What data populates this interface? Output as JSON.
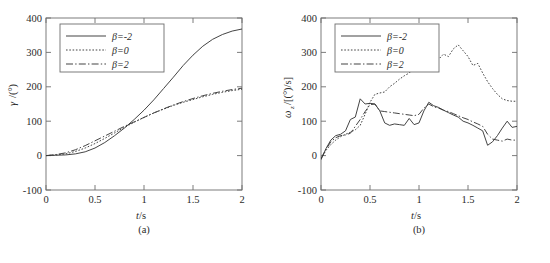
{
  "figure": {
    "background": "#ffffff",
    "line_color": "#3a3a3a",
    "axis_color": "#6e6e6e",
    "panels": [
      "a",
      "b"
    ]
  },
  "panel_a": {
    "caption": "(a)",
    "xlabel": "t/s",
    "ylabel": "γ/(°)",
    "ylabel_italic": "γ",
    "ylabel_rest": "/(°)",
    "xticks": [
      "0",
      "0.5",
      "1",
      "1.5",
      "2"
    ],
    "yticks": [
      "-100",
      "0",
      "100",
      "200",
      "300",
      "400"
    ],
    "legend": [
      {
        "label": "β=-2",
        "style": "solid"
      },
      {
        "label": "β=0",
        "style": "dotted"
      },
      {
        "label": "β=2",
        "style": "dashdot"
      }
    ]
  },
  "panel_b": {
    "caption": "(b)",
    "xlabel": "t/s",
    "ylabel": "ωz/[(°)/s]",
    "ylabel_italic": "ω",
    "ylabel_sub": "z",
    "ylabel_rest": "/[(°)/s]",
    "xticks": [
      "0",
      "0.5",
      "1",
      "1.5",
      "2"
    ],
    "yticks": [
      "-100",
      "0",
      "100",
      "200",
      "300",
      "400"
    ],
    "legend": [
      {
        "label": "β=-2",
        "style": "solid"
      },
      {
        "label": "β=0",
        "style": "dotted"
      },
      {
        "label": "β=2",
        "style": "dashdot"
      }
    ]
  },
  "chart_data": [
    {
      "type": "line",
      "title": "(a)",
      "xlabel": "t/s",
      "ylabel": "γ/(°)",
      "xlim": [
        0,
        2
      ],
      "ylim": [
        -100,
        400
      ],
      "xticks": [
        0,
        0.5,
        1,
        1.5,
        2
      ],
      "yticks": [
        -100,
        0,
        100,
        200,
        300,
        400
      ],
      "grid": false,
      "legend_position": "upper-left",
      "x": [
        0,
        0.1,
        0.2,
        0.3,
        0.4,
        0.5,
        0.6,
        0.7,
        0.8,
        0.9,
        1.0,
        1.1,
        1.2,
        1.3,
        1.4,
        1.5,
        1.6,
        1.7,
        1.8,
        1.9,
        2.0
      ],
      "series": [
        {
          "name": "β=-2",
          "style": "solid",
          "values": [
            0,
            1,
            2,
            5,
            11,
            22,
            38,
            58,
            80,
            105,
            132,
            162,
            195,
            228,
            262,
            292,
            318,
            338,
            352,
            362,
            368
          ]
        },
        {
          "name": "β=0",
          "style": "dotted",
          "values": [
            0,
            2,
            5,
            12,
            22,
            35,
            50,
            66,
            82,
            97,
            111,
            124,
            135,
            146,
            155,
            163,
            171,
            178,
            184,
            189,
            193
          ]
        },
        {
          "name": "β=2",
          "style": "dashdot",
          "values": [
            0,
            3,
            8,
            17,
            29,
            43,
            57,
            71,
            85,
            98,
            111,
            124,
            136,
            147,
            157,
            166,
            174,
            181,
            187,
            192,
            196
          ]
        }
      ]
    },
    {
      "type": "line",
      "title": "(b)",
      "xlabel": "t/s",
      "ylabel": "ωz/[(°)/s]",
      "xlim": [
        0,
        2
      ],
      "ylim": [
        -100,
        400
      ],
      "xticks": [
        0,
        0.5,
        1,
        1.5,
        2
      ],
      "yticks": [
        -100,
        0,
        100,
        200,
        300,
        400
      ],
      "grid": false,
      "legend_position": "upper-left",
      "x": [
        0,
        0.05,
        0.1,
        0.15,
        0.2,
        0.25,
        0.3,
        0.35,
        0.4,
        0.45,
        0.5,
        0.55,
        0.6,
        0.65,
        0.7,
        0.75,
        0.8,
        0.85,
        0.9,
        0.95,
        1.0,
        1.05,
        1.1,
        1.15,
        1.2,
        1.25,
        1.3,
        1.35,
        1.4,
        1.45,
        1.5,
        1.55,
        1.6,
        1.65,
        1.7,
        1.75,
        1.8,
        1.85,
        1.9,
        1.95,
        2.0
      ],
      "series": [
        {
          "name": "β=-2",
          "style": "solid",
          "values": [
            -12,
            20,
            45,
            58,
            62,
            72,
            105,
            112,
            165,
            150,
            152,
            150,
            130,
            95,
            88,
            92,
            90,
            88,
            108,
            90,
            95,
            130,
            155,
            145,
            140,
            132,
            125,
            118,
            112,
            100,
            95,
            88,
            80,
            72,
            30,
            40,
            58,
            80,
            100,
            82,
            85
          ]
        },
        {
          "name": "β=0",
          "style": "dotted",
          "values": [
            -10,
            15,
            32,
            45,
            55,
            62,
            68,
            75,
            88,
            120,
            155,
            178,
            182,
            185,
            200,
            210,
            222,
            232,
            240,
            255,
            248,
            262,
            272,
            265,
            280,
            295,
            288,
            310,
            322,
            305,
            288,
            262,
            268,
            240,
            215,
            195,
            178,
            165,
            160,
            158,
            158
          ]
        },
        {
          "name": "β=2",
          "style": "dashdot",
          "values": [
            -8,
            18,
            40,
            52,
            58,
            60,
            65,
            85,
            105,
            128,
            148,
            150,
            130,
            128,
            126,
            124,
            122,
            120,
            118,
            116,
            120,
            138,
            150,
            142,
            138,
            132,
            128,
            122,
            116,
            110,
            105,
            98,
            92,
            85,
            62,
            48,
            45,
            42,
            48,
            45,
            45
          ]
        }
      ]
    }
  ]
}
